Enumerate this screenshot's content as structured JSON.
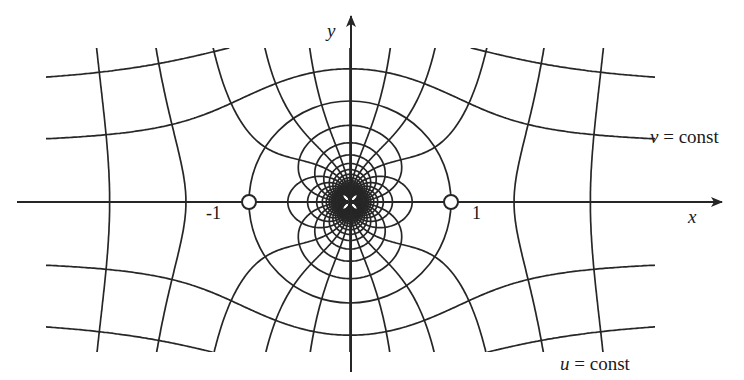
{
  "figure": {
    "type": "conformal-map-grid",
    "mapping": "w = z + 1/z",
    "colors": {
      "line": "#262626",
      "background": "#ffffff",
      "hole_fill": "#ffffff"
    }
  },
  "axes": {
    "x_label": "x",
    "y_label": "y",
    "tick_minus_one": "-1",
    "tick_plus_one": "1"
  },
  "annotations": {
    "v_const": {
      "var": "v",
      "rest": " = const"
    },
    "u_const": {
      "var": "u",
      "rest": " = const"
    }
  },
  "critical_points": [
    {
      "x": -1,
      "y": 0,
      "label": "-1"
    },
    {
      "x": 1,
      "y": 0,
      "label": "1"
    }
  ],
  "geometry": {
    "origin_px": [
      350,
      202
    ],
    "unit_px": 101,
    "level_step": 0.56,
    "max_level": 12,
    "grid_box_px": {
      "left": 46,
      "right": 655,
      "top": 48,
      "bottom": 352
    },
    "x_axis_px": {
      "x1": 17,
      "x2": 722,
      "y": 202
    },
    "y_axis_px": {
      "x": 351,
      "y1": 16,
      "y2": 372
    },
    "hole_radius_px": 7
  }
}
